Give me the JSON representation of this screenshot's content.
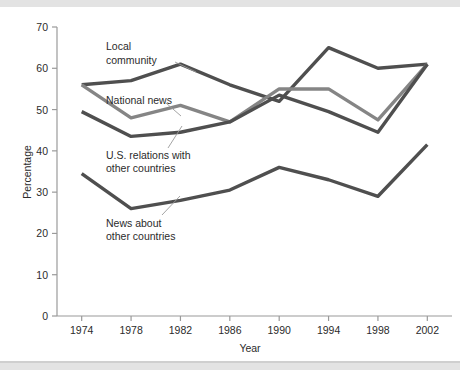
{
  "chart_data": {
    "type": "line",
    "title": "",
    "subtitle": "",
    "xlabel": "Year",
    "ylabel": "Percentage",
    "x": [
      1974,
      1978,
      1982,
      1986,
      1990,
      1994,
      1998,
      2002
    ],
    "xtick_labels": [
      "1974",
      "1978",
      "1982",
      "1986",
      "1990",
      "1994",
      "1998",
      "2002"
    ],
    "ytick_labels": [
      "0",
      "10",
      "20",
      "30",
      "40",
      "50",
      "60",
      "70"
    ],
    "ytick_values": [
      0,
      10,
      20,
      30,
      40,
      50,
      60,
      70
    ],
    "xlim": [
      1972,
      2004
    ],
    "ylim": [
      0,
      70
    ],
    "grid": false,
    "legend": "inline-annotations",
    "legend_position": "none",
    "series": [
      {
        "name": "Local community",
        "color": "#4f4f4f",
        "values": [
          56,
          57,
          61,
          56,
          52,
          65,
          60,
          61
        ]
      },
      {
        "name": "National news",
        "color": "#858585",
        "values": [
          56,
          48,
          51,
          47,
          55,
          55,
          47.5,
          61
        ]
      },
      {
        "name": "U.S. relations with other countries",
        "color": "#4f4f4f",
        "values": [
          49.5,
          43.5,
          44.5,
          47,
          53.5,
          49.5,
          44.5,
          61
        ]
      },
      {
        "name": "News about other countries",
        "color": "#4f4f4f",
        "values": [
          34.5,
          26,
          28,
          30.5,
          36,
          33,
          29,
          41.5
        ]
      }
    ],
    "annotations": [
      {
        "text_line1": "Local",
        "text_line2": "community",
        "series": "Local community"
      },
      {
        "text_line1": "National news",
        "text_line2": "",
        "series": "National news"
      },
      {
        "text_line1": "U.S. relations with",
        "text_line2": "other countries",
        "series": "U.S. relations with other countries"
      },
      {
        "text_line1": "News about",
        "text_line2": "other countries",
        "series": "News about other countries"
      }
    ]
  },
  "axes": {
    "y_title": "Percentage",
    "x_title": "Year",
    "yticks": [
      "70",
      "60",
      "50",
      "40",
      "30",
      "20",
      "10",
      "0"
    ],
    "xticks": [
      "1974",
      "1978",
      "1982",
      "1986",
      "1990",
      "1994",
      "1998",
      "2002"
    ]
  },
  "colors": {
    "line_dark": "#4f4f4f",
    "line_light": "#858585",
    "axis": "#9a9a9a",
    "text": "#2b2b2b",
    "band": "#e3e3e3",
    "background": "#ffffff"
  }
}
